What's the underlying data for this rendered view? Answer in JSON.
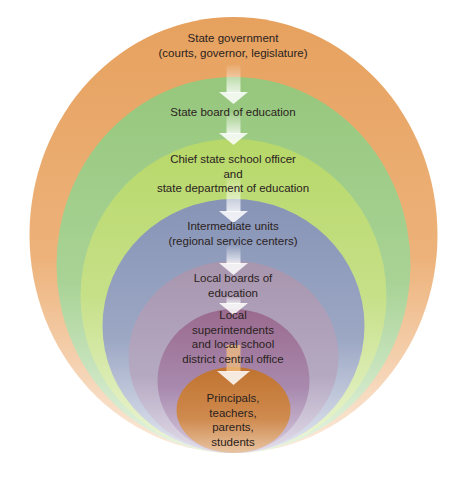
{
  "diagram": {
    "type": "nested-ellipses-hierarchy",
    "levels": [
      {
        "id": "state-government",
        "lines": [
          "State government",
          "(courts, governor, legislature)"
        ],
        "color": "#E8A866"
      },
      {
        "id": "state-board",
        "lines": [
          "State board of education"
        ],
        "color": "#9CCB82"
      },
      {
        "id": "chief-officer",
        "lines": [
          "Chief state school officer",
          "and",
          "state department of education"
        ],
        "color": "#C0DC7A"
      },
      {
        "id": "intermediate-units",
        "lines": [
          "Intermediate units",
          "(regional service centers)"
        ],
        "color": "#8B98B8"
      },
      {
        "id": "local-boards",
        "lines": [
          "Local boards of",
          "education"
        ],
        "color": "#A99AB4"
      },
      {
        "id": "local-superintendents",
        "lines": [
          "Local",
          "superintendents",
          "and local school",
          "district central office"
        ],
        "color": "#9E7495"
      },
      {
        "id": "principals",
        "lines": [
          "Principals,",
          "teachers,",
          "parents,",
          "students"
        ],
        "color": "#C57A3A"
      }
    ],
    "arrow_color": "#ffffff"
  }
}
